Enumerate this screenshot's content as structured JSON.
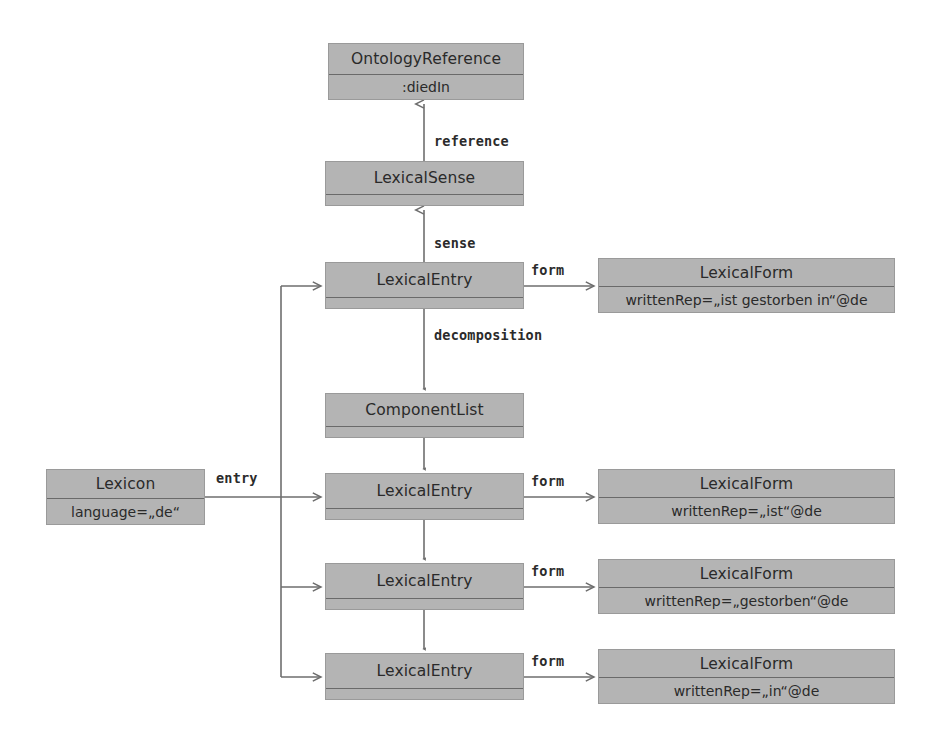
{
  "diagram": {
    "style": {
      "box_fill": "#b4b4b4",
      "box_border": "#9a9a9a",
      "divider": "#6a6a6a",
      "edge_color": "#6e6e6e",
      "text_color": "#2a2a2a",
      "background": "#ffffff"
    }
  },
  "nodes": [
    {
      "id": "ontology-reference",
      "title": "OntologyReference",
      "attr": ":diedIn",
      "x": 328,
      "y": 43,
      "w": 196,
      "h": 57,
      "title_h": 30
    },
    {
      "id": "lexical-sense",
      "title": "LexicalSense",
      "attr": "",
      "x": 325,
      "y": 161,
      "w": 199,
      "h": 45,
      "title_h": 32
    },
    {
      "id": "lexical-entry-1",
      "title": "LexicalEntry",
      "attr": "",
      "x": 325,
      "y": 262,
      "w": 199,
      "h": 47,
      "title_h": 34
    },
    {
      "id": "lexical-form-1",
      "title": "LexicalForm",
      "attr": "writtenRep=„ist gestorben in“@de",
      "x": 598,
      "y": 258,
      "w": 297,
      "h": 55,
      "title_h": 27
    },
    {
      "id": "component-list",
      "title": "ComponentList",
      "attr": "",
      "x": 325,
      "y": 393,
      "w": 199,
      "h": 45,
      "title_h": 32
    },
    {
      "id": "lexicon",
      "title": "Lexicon",
      "attr": "language=„de“",
      "x": 46,
      "y": 469,
      "w": 159,
      "h": 56,
      "title_h": 28
    },
    {
      "id": "lexical-entry-2",
      "title": "LexicalEntry",
      "attr": "",
      "x": 325,
      "y": 473,
      "w": 199,
      "h": 47,
      "title_h": 34
    },
    {
      "id": "lexical-form-2",
      "title": "LexicalForm",
      "attr": "writtenRep=„ist“@de",
      "x": 598,
      "y": 469,
      "w": 297,
      "h": 55,
      "title_h": 27
    },
    {
      "id": "lexical-entry-3",
      "title": "LexicalEntry",
      "attr": "",
      "x": 325,
      "y": 563,
      "w": 199,
      "h": 47,
      "title_h": 34
    },
    {
      "id": "lexical-form-3",
      "title": "LexicalForm",
      "attr": "writtenRep=„gestorben“@de",
      "x": 598,
      "y": 559,
      "w": 297,
      "h": 55,
      "title_h": 27
    },
    {
      "id": "lexical-entry-4",
      "title": "LexicalEntry",
      "attr": "",
      "x": 325,
      "y": 653,
      "w": 199,
      "h": 47,
      "title_h": 34
    },
    {
      "id": "lexical-form-4",
      "title": "LexicalForm",
      "attr": "writtenRep=„in“@de",
      "x": 598,
      "y": 649,
      "w": 297,
      "h": 55,
      "title_h": 27
    }
  ],
  "edge_labels": [
    {
      "id": "reference",
      "text": "reference",
      "x": 434,
      "y": 133
    },
    {
      "id": "sense",
      "text": "sense",
      "x": 434,
      "y": 235
    },
    {
      "id": "form-1",
      "text": "form",
      "x": 531,
      "y": 262
    },
    {
      "id": "decomposition",
      "text": "decomposition",
      "x": 434,
      "y": 327
    },
    {
      "id": "entry",
      "text": "entry",
      "x": 216,
      "y": 470
    },
    {
      "id": "form-2",
      "text": "form",
      "x": 531,
      "y": 473
    },
    {
      "id": "form-3",
      "text": "form",
      "x": 531,
      "y": 563
    },
    {
      "id": "form-4",
      "text": "form",
      "x": 531,
      "y": 653
    }
  ],
  "edges": [
    {
      "id": "sense-to-ontologyreference",
      "from": "lexical-sense",
      "to": "ontology-reference",
      "label": "reference"
    },
    {
      "id": "entry-to-sense",
      "from": "lexical-entry-1",
      "to": "lexical-sense",
      "label": "sense"
    },
    {
      "id": "entry1-to-form1",
      "from": "lexical-entry-1",
      "to": "lexical-form-1",
      "label": "form"
    },
    {
      "id": "entry1-to-componentlist",
      "from": "lexical-entry-1",
      "to": "component-list",
      "label": "decomposition"
    },
    {
      "id": "componentlist-to-entry2",
      "from": "component-list",
      "to": "lexical-entry-2",
      "label": ""
    },
    {
      "id": "entry2-to-entry3",
      "from": "lexical-entry-2",
      "to": "lexical-entry-3",
      "label": ""
    },
    {
      "id": "entry3-to-entry4",
      "from": "lexical-entry-3",
      "to": "lexical-entry-4",
      "label": ""
    },
    {
      "id": "lexicon-to-entry1",
      "from": "lexicon",
      "to": "lexical-entry-1",
      "label": "entry"
    },
    {
      "id": "lexicon-to-entry2",
      "from": "lexicon",
      "to": "lexical-entry-2",
      "label": "entry"
    },
    {
      "id": "lexicon-to-entry3",
      "from": "lexicon",
      "to": "lexical-entry-3",
      "label": "entry"
    },
    {
      "id": "lexicon-to-entry4",
      "from": "lexicon",
      "to": "lexical-entry-4",
      "label": "entry"
    },
    {
      "id": "entry2-to-form2",
      "from": "lexical-entry-2",
      "to": "lexical-form-2",
      "label": "form"
    },
    {
      "id": "entry3-to-form3",
      "from": "lexical-entry-3",
      "to": "lexical-form-3",
      "label": "form"
    },
    {
      "id": "entry4-to-form4",
      "from": "lexical-entry-4",
      "to": "lexical-form-4",
      "label": "form"
    }
  ]
}
